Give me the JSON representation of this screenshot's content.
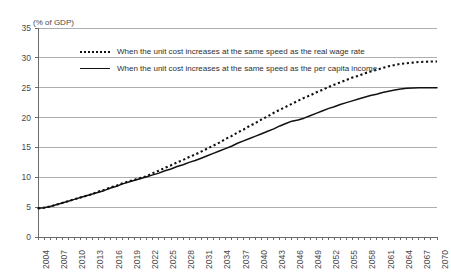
{
  "chart_data": {
    "type": "line",
    "title": "",
    "subtitle": "",
    "xlabel": "",
    "ylabel": "",
    "axis_unit_note": "(% of GDP)",
    "xlim": [
      2004,
      2070
    ],
    "ylim": [
      0,
      35
    ],
    "ytick_step": 5,
    "xtick_step": 3,
    "grid": true,
    "legend_position": "top-left-inside",
    "yticks": [
      "35",
      "30",
      "25",
      "20",
      "15",
      "10",
      "5",
      "0"
    ],
    "xticks": [
      "2004",
      "2007",
      "2010",
      "2013",
      "2016",
      "2019",
      "2022",
      "2025",
      "2028",
      "2031",
      "2034",
      "2037",
      "2040",
      "2043",
      "2046",
      "2049",
      "2052",
      "2055",
      "2058",
      "2061",
      "2064",
      "2067",
      "2070"
    ],
    "x": [
      2004,
      2005,
      2006,
      2007,
      2008,
      2009,
      2010,
      2011,
      2012,
      2013,
      2014,
      2015,
      2016,
      2017,
      2018,
      2019,
      2020,
      2021,
      2022,
      2023,
      2024,
      2025,
      2026,
      2027,
      2028,
      2029,
      2030,
      2031,
      2032,
      2033,
      2034,
      2035,
      2036,
      2037,
      2038,
      2039,
      2040,
      2041,
      2042,
      2043,
      2044,
      2045,
      2046,
      2047,
      2048,
      2049,
      2050,
      2051,
      2052,
      2053,
      2054,
      2055,
      2056,
      2057,
      2058,
      2059,
      2060,
      2061,
      2062,
      2063,
      2064,
      2065,
      2066,
      2067,
      2068,
      2069,
      2070
    ],
    "series": [
      {
        "name": "When the unit cost increases at the same speed as the real wage rate",
        "style": "dotted",
        "color": "#111111",
        "values": [
          4.8,
          4.9,
          5.1,
          5.4,
          5.7,
          6.0,
          6.3,
          6.6,
          6.9,
          7.2,
          7.6,
          7.9,
          8.3,
          8.6,
          9.0,
          9.3,
          9.6,
          9.9,
          10.2,
          10.7,
          11.1,
          11.6,
          12.0,
          12.5,
          12.9,
          13.4,
          13.8,
          14.3,
          14.8,
          15.3,
          15.8,
          16.4,
          16.9,
          17.5,
          18.0,
          18.6,
          19.1,
          19.7,
          20.2,
          20.8,
          21.3,
          21.8,
          22.3,
          22.8,
          23.3,
          23.7,
          24.2,
          24.6,
          25.1,
          25.5,
          25.9,
          26.3,
          26.7,
          27.0,
          27.4,
          27.7,
          28.0,
          28.3,
          28.6,
          28.8,
          29.0,
          29.1,
          29.2,
          29.3,
          29.35,
          29.4,
          29.4
        ]
      },
      {
        "name": "When the unit cost increases at the same speed as the per capita income",
        "style": "solid",
        "color": "#111111",
        "values": [
          4.8,
          4.9,
          5.1,
          5.4,
          5.7,
          6.0,
          6.3,
          6.6,
          6.9,
          7.2,
          7.5,
          7.8,
          8.2,
          8.5,
          8.9,
          9.2,
          9.5,
          9.8,
          10.1,
          10.4,
          10.7,
          11.1,
          11.4,
          11.8,
          12.1,
          12.5,
          12.8,
          13.2,
          13.6,
          14.0,
          14.4,
          14.8,
          15.2,
          15.7,
          16.1,
          16.5,
          16.9,
          17.3,
          17.7,
          18.1,
          18.6,
          19.0,
          19.4,
          19.6,
          19.9,
          20.3,
          20.7,
          21.1,
          21.5,
          21.8,
          22.2,
          22.5,
          22.8,
          23.1,
          23.4,
          23.7,
          23.9,
          24.2,
          24.4,
          24.6,
          24.8,
          24.9,
          24.95,
          25.0,
          25.0,
          25.0,
          25.0
        ]
      }
    ]
  }
}
